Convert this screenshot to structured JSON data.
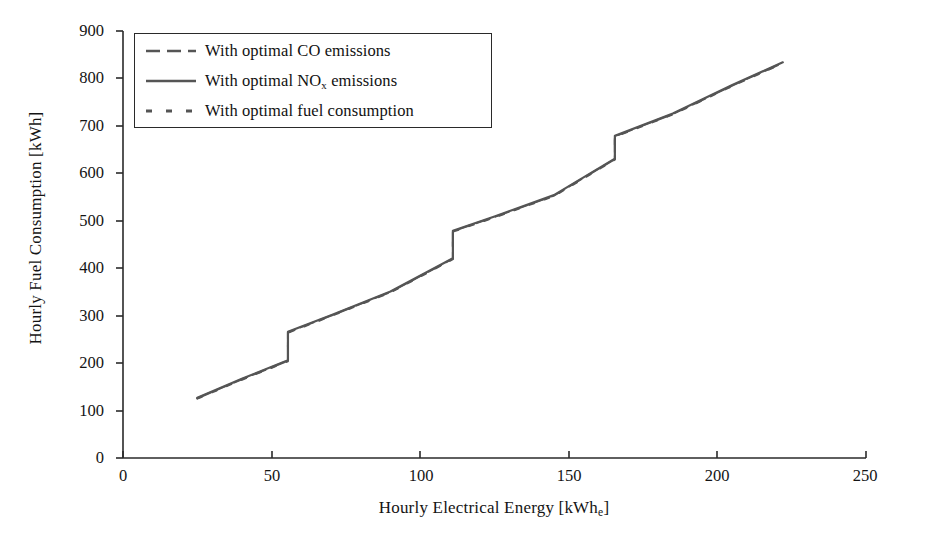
{
  "chart_data": {
    "type": "line",
    "title": "",
    "xlabel": "Hourly Electrical Energy [kWh",
    "xlabel_sub": "e",
    "xlabel_tail": "]",
    "ylabel": "Hourly Fuel Consumption [kWh]",
    "xlim": [
      0,
      250
    ],
    "ylim": [
      0,
      900
    ],
    "xticks": [
      0,
      50,
      100,
      150,
      200,
      250
    ],
    "yticks": [
      0,
      100,
      200,
      300,
      400,
      500,
      600,
      700,
      800,
      900
    ],
    "grid": false,
    "legend_position": "upper-left-inside",
    "line_color": "#555555",
    "axis_color": "#2a2a2a",
    "series": [
      {
        "name": "With optimal CO emissions",
        "legend_style": "long-dash",
        "x": [
          25,
          40,
          55.5,
          55.5,
          70,
          90,
          111,
          111,
          125,
          145,
          165.5,
          165.5,
          185,
          205,
          222
        ],
        "y": [
          126,
          166,
          205,
          265,
          300,
          350,
          420,
          478,
          508,
          553,
          630,
          678,
          725,
          785,
          833
        ]
      },
      {
        "name": "With optimal NOx emissions",
        "legend_style": "solid",
        "x": [
          25,
          40,
          55.5,
          55.5,
          70,
          90,
          111,
          111,
          125,
          145,
          165.5,
          165.5,
          185,
          205,
          222
        ],
        "y": [
          127,
          167,
          206,
          266,
          301,
          351,
          421,
          479,
          509,
          554,
          631,
          679,
          726,
          786,
          834
        ]
      },
      {
        "name": "With optimal fuel consumption",
        "legend_style": "short-dash",
        "x": [
          25,
          40,
          55.5,
          55.5,
          70,
          90,
          111,
          111,
          125,
          145,
          165.5,
          165.5,
          185,
          205,
          222
        ],
        "y": [
          125,
          165,
          204,
          264,
          299,
          349,
          419,
          477,
          507,
          552,
          629,
          677,
          724,
          784,
          832
        ]
      }
    ],
    "annotations": [
      {
        "label": "step-1",
        "x": 55.5,
        "y_from": 205,
        "y_to": 265
      },
      {
        "label": "step-2",
        "x": 111,
        "y_from": 420,
        "y_to": 478
      },
      {
        "label": "step-3",
        "x": 165.5,
        "y_from": 630,
        "y_to": 678
      }
    ]
  },
  "axes": {
    "y_tick_labels": [
      "900",
      "800",
      "700",
      "600",
      "500",
      "400",
      "300",
      "200",
      "100",
      "0"
    ],
    "x_tick_labels": [
      "0",
      "50",
      "100",
      "150",
      "200",
      "250"
    ]
  },
  "legend": {
    "entries": [
      {
        "label_pre": "With optimal CO emissions",
        "label_sub": "",
        "label_post": ""
      },
      {
        "label_pre": "With optimal NO",
        "label_sub": "x",
        "label_post": " emissions"
      },
      {
        "label_pre": "With optimal fuel consumption",
        "label_sub": "",
        "label_post": ""
      }
    ]
  }
}
